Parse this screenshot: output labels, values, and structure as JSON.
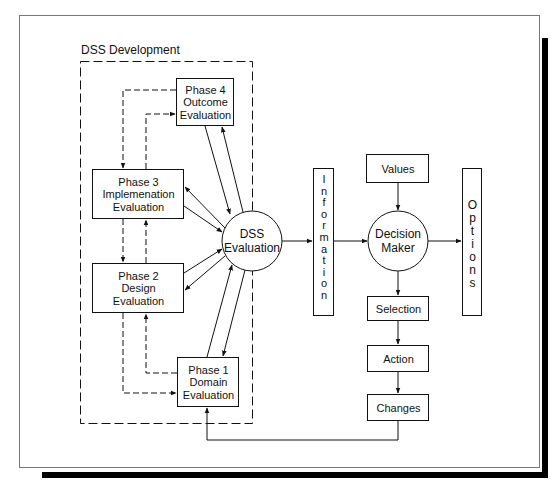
{
  "diagram": {
    "group_label": "DSS Development",
    "phases": [
      {
        "id": "phase4",
        "line1": "Phase 4",
        "line2": "Outcome",
        "line3": "Evaluation"
      },
      {
        "id": "phase3",
        "line1": "Phase 3",
        "line2": "Implemenation",
        "line3": "Evaluation"
      },
      {
        "id": "phase2",
        "line1": "Phase 2",
        "line2": "Design",
        "line3": "Evaluation"
      },
      {
        "id": "phase1",
        "line1": "Phase 1",
        "line2": "Domain",
        "line3": "Evaluation"
      }
    ],
    "dss_evaluation": {
      "line1": "DSS",
      "line2": "Evaluation"
    },
    "information": {
      "letters": [
        "I",
        "n",
        "f",
        "o",
        "r",
        "m",
        "a",
        "t",
        "i",
        "o",
        "n"
      ]
    },
    "decision_maker": {
      "line1": "Decision",
      "line2": "Maker"
    },
    "values": "Values",
    "options": {
      "letters": [
        "O",
        "p",
        "t",
        "i",
        "o",
        "n",
        "s"
      ]
    },
    "selection": "Selection",
    "action": "Action",
    "changes": "Changes",
    "colors": {
      "stroke": "#111111",
      "background": "#ffffff",
      "shadow": "#000000"
    }
  }
}
